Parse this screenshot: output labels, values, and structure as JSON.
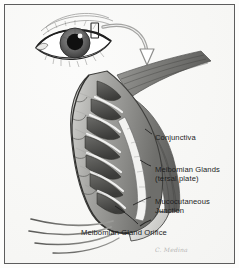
{
  "figure": {
    "medium": "grayscale pen-and-ink medical illustration",
    "border_color": "#5d5d5d",
    "background_color": "#ffffff"
  },
  "inset": {
    "name": "eye-inset",
    "description": "frontal view of a human eye with upper eyelid marker rectangle",
    "marker_label": ""
  },
  "arrow": {
    "name": "magnification-arrow",
    "description": "curved outline arrow from eyelid marker to magnified cross-section",
    "color": "#8d8d8d"
  },
  "diagram": {
    "name": "eyelid-cross-section",
    "structures": [
      "tarsal plate",
      "meibomian glands",
      "conjunctiva",
      "eyelashes",
      "lid margin"
    ]
  },
  "labels": [
    {
      "id": "conjunctiva",
      "line1": "Conjunctiva",
      "line2": ""
    },
    {
      "id": "meibomian-glands",
      "line1": "Meibomian Glands",
      "line2": "(tersal plate)"
    },
    {
      "id": "mucocutaneous",
      "line1": "Mucocutaneous",
      "line2": "Junction"
    },
    {
      "id": "orifice",
      "line1": "Meibomian Gland Orifice",
      "line2": ""
    }
  ],
  "credit": {
    "signature": "C. Medina"
  },
  "palette": {
    "ink": "#1d1d1d",
    "mid_gray": "#8d8d8d",
    "light_gray": "#c9c9c7",
    "dark_gray": "#4a4a4a",
    "paper": "#f6f6f4"
  }
}
